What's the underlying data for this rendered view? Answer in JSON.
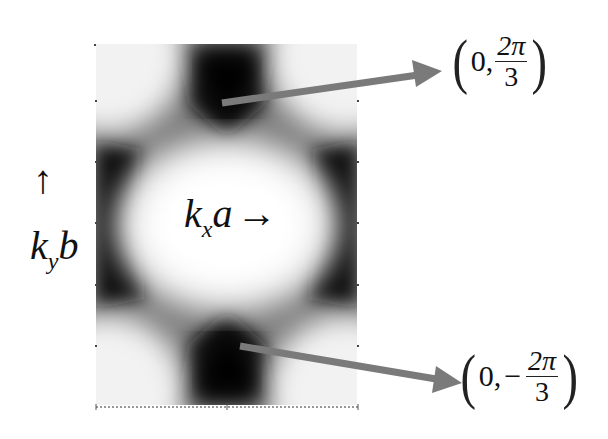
{
  "figure": {
    "type": "intensity-map",
    "colormap": "grayscale",
    "colors": {
      "arrow": "#7a7a7a",
      "dark": "#0a0a0a",
      "light": "#ffffff"
    }
  },
  "labels": {
    "kx": {
      "k": "k",
      "sub": "x",
      "var": "a",
      "arrow": "→"
    },
    "ky": {
      "k": "k",
      "sub": "y",
      "var": "b",
      "arrow": "↑"
    }
  },
  "annotations": [
    {
      "name": "top-point",
      "open": "(",
      "first": "0,",
      "sign": "",
      "num": "2π",
      "den": "3",
      "close": ")"
    },
    {
      "name": "bottom-point",
      "open": "(",
      "first": "0,",
      "sign": "−",
      "num": "2π",
      "den": "3",
      "close": ")"
    }
  ]
}
